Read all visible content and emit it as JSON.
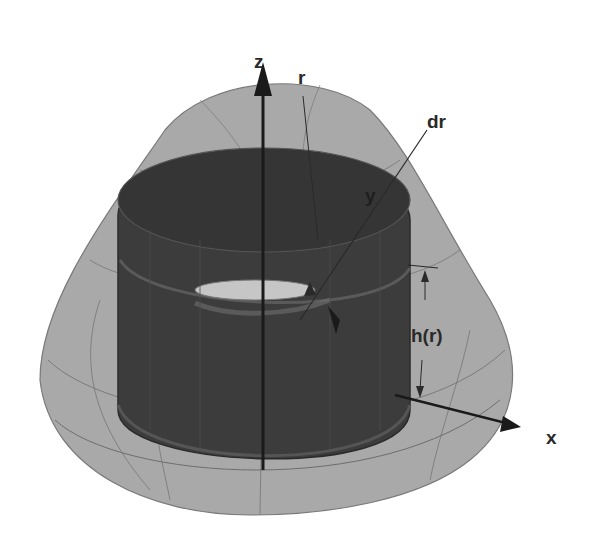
{
  "diagram": {
    "labels": {
      "z_axis": "z",
      "x_axis": "x",
      "y_axis": "y",
      "radius": "r",
      "shell_thickness": "dr",
      "shell_height": "h(r)"
    },
    "colors": {
      "background": "#ffffff",
      "outer_surface": "#a8a8a8",
      "outer_surface_top": "#9a9a9a",
      "cylinder_shell": "#3a3a3a",
      "inner_hole": "#c4c4c4",
      "grid_lines": "#6e6e6e",
      "axes": "#1a1a1a",
      "label_text": "#2a2a2a"
    }
  }
}
